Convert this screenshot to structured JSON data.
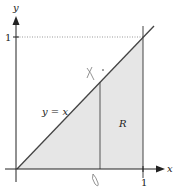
{
  "diagram": {
    "title": "",
    "axes": {
      "x_label": "x",
      "y_label": "y",
      "x_tick_label": "1",
      "y_tick_label": "1"
    },
    "line_label": "y = x",
    "region_label": "R",
    "annotations": {
      "handwritten_x": "x",
      "handwritten_bottom": "0"
    },
    "colors": {
      "region_fill": "#e6e6e6",
      "line": "#444444",
      "axis": "#222222",
      "dotted": "#999999"
    }
  }
}
